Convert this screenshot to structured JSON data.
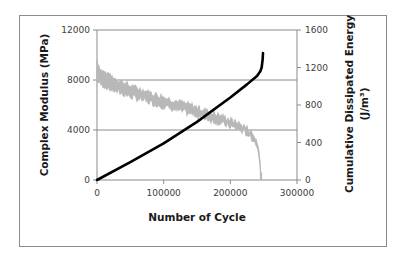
{
  "chart_data": {
    "type": "line",
    "title": "",
    "xlabel": "Number of Cycle",
    "ylabel": "Complex Modulus (MPa)",
    "y2label_line1": "Cumulative Dissipated Energy",
    "y2label_line2": "(J/m³)",
    "xlim": [
      0,
      300000
    ],
    "ylim": [
      0,
      12000
    ],
    "y2lim": [
      0,
      1600
    ],
    "x_ticks": [
      "0",
      "100000",
      "200000",
      "300000"
    ],
    "y_ticks": [
      "0",
      "4000",
      "8000",
      "12000"
    ],
    "y2_ticks": [
      "0",
      "400",
      "800",
      "1200",
      "1600"
    ],
    "grid": "horizontal major gridlines",
    "legend": "none",
    "series": [
      {
        "name": "Complex Modulus",
        "axis": "left",
        "color": "#b8b8b8",
        "style": "noisy band",
        "x": [
          0,
          5000,
          20000,
          50000,
          100000,
          150000,
          200000,
          220000,
          230000,
          238000,
          242000,
          244000,
          245500,
          246000
        ],
        "lower": [
          8000,
          7700,
          7300,
          6700,
          5900,
          5200,
          4300,
          3900,
          3500,
          3000,
          2300,
          1500,
          500,
          0
        ],
        "upper": [
          9600,
          8800,
          8300,
          7500,
          6600,
          5800,
          4800,
          4300,
          3900,
          3300,
          2600,
          1800,
          700,
          0
        ]
      },
      {
        "name": "Cumulative Dissipated Energy",
        "axis": "right",
        "color": "#000000",
        "style": "thick solid line",
        "x": [
          0,
          50000,
          100000,
          150000,
          200000,
          225000,
          240000,
          245000,
          247000,
          248500,
          249000
        ],
        "values": [
          0,
          190,
          390,
          620,
          880,
          1020,
          1110,
          1160,
          1200,
          1290,
          1355
        ]
      }
    ]
  }
}
